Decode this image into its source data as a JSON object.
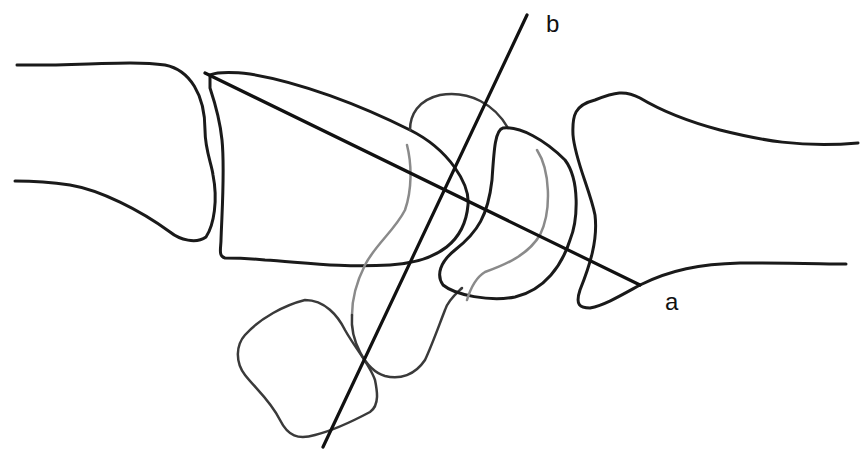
{
  "diagram": {
    "type": "anatomical line drawing",
    "labels": {
      "axis_a": "a",
      "axis_b": "b"
    },
    "colors": {
      "line": "#1a1a1a",
      "hidden_contour": "#8a8a8a",
      "background": "#ffffff"
    }
  }
}
